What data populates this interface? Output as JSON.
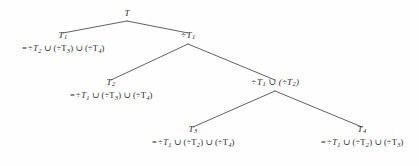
{
  "figure": {
    "type": "binary-tree-diagram",
    "title": "",
    "background_color": "#fefefe",
    "ink_color": "#2b2b2b",
    "symbols": {
      "complement": "÷",
      "union": "∪",
      "equals": "=",
      "paren_open": "(",
      "paren_close": ")"
    }
  },
  "nodes": [
    {
      "id": "root",
      "label": "T",
      "subscript": "",
      "expression": "",
      "x": 127,
      "y": 11,
      "align": "center"
    },
    {
      "id": "n-t1",
      "label": "T",
      "subscript": "1",
      "expression": "= ÷T₂ ∪ (÷T₃) ∪ (÷T₄)",
      "x": 63,
      "y": 33,
      "align": "center"
    },
    {
      "id": "n-not-t1",
      "label": "÷T",
      "subscript": "1",
      "expression": "",
      "x": 188,
      "y": 33,
      "align": "center"
    },
    {
      "id": "n-t2",
      "label": "T",
      "subscript": "2",
      "expression": "= ÷T₁ ∪ (÷T₃) ∪ (÷T₄)",
      "x": 111,
      "y": 80,
      "align": "center"
    },
    {
      "id": "n-not-t1-union-not-t2",
      "label": "÷T₁ ∪ (÷T₂)",
      "subscript": "",
      "expression": "",
      "x": 275,
      "y": 80,
      "align": "center"
    },
    {
      "id": "n-t3",
      "label": "T",
      "subscript": "3",
      "expression": "= ÷T₁ ∪ (÷T₂) ∪ (÷T₄)",
      "x": 193,
      "y": 127,
      "align": "center"
    },
    {
      "id": "n-t4",
      "label": "T",
      "subscript": "4",
      "expression": "= ÷T₁ ∪ (÷T₂) ∪ (÷T₃)",
      "x": 362,
      "y": 127,
      "align": "center"
    }
  ],
  "node_text": {
    "root": {
      "label": "T"
    },
    "t1": {
      "label": "T",
      "sub": "1",
      "eq": "=",
      "term1_op": "÷",
      "term1_var": "T",
      "term1_sub": "2",
      "u1": "∪",
      "term2": "(÷T",
      "term2_sub": "3",
      "term2_close": ")",
      "u2": "∪",
      "term3": "(÷T",
      "term3_sub": "4",
      "term3_close": ")"
    },
    "not_t1": {
      "op": "÷",
      "label": "T",
      "sub": "1"
    },
    "t2": {
      "label": "T",
      "sub": "2",
      "eq": "=",
      "term1_op": "÷",
      "term1_var": "T",
      "term1_sub": "1",
      "u1": "∪",
      "term2": "(÷T",
      "term2_sub": "3",
      "term2_close": ")",
      "u2": "∪",
      "term3": "(÷T",
      "term3_sub": "4",
      "term3_close": ")"
    },
    "not_t1_u_not_t2": {
      "op1": "÷",
      "var1": "T",
      "sub1": "1",
      "u1": "∪",
      "open": "(÷T",
      "sub2": "2",
      "close": ")"
    },
    "t3": {
      "label": "T",
      "sub": "3",
      "eq": "=",
      "term1_op": "÷",
      "term1_var": "T",
      "term1_sub": "1",
      "u1": "∪",
      "term2": "(÷T",
      "term2_sub": "2",
      "term2_close": ")",
      "u2": "∪",
      "term3": "(÷T",
      "term3_sub": "4",
      "term3_close": ")"
    },
    "t4": {
      "label": "T",
      "sub": "4",
      "eq": "=",
      "term1_op": "÷",
      "term1_var": "T",
      "term1_sub": "1",
      "u1": "∪",
      "term2": "(÷T",
      "term2_sub": "2",
      "term2_close": ")",
      "u2": "∪",
      "term3": "(÷T",
      "term3_sub": "3",
      "term3_close": ")"
    }
  },
  "edges": [
    {
      "id": "root-to-t1",
      "from": "root",
      "to": "n-t1",
      "x1": 127,
      "y1": 21,
      "x2": 63,
      "y2": 33
    },
    {
      "id": "root-to-not-t1",
      "from": "root",
      "to": "n-not-t1",
      "x1": 127,
      "y1": 21,
      "x2": 188,
      "y2": 33
    },
    {
      "id": "nott1-to-t2",
      "from": "n-not-t1",
      "to": "n-t2",
      "x1": 188,
      "y1": 44,
      "x2": 111,
      "y2": 80
    },
    {
      "id": "nott1-to-union",
      "from": "n-not-t1",
      "to": "n-not-t1-union-not-t2",
      "x1": 188,
      "y1": 44,
      "x2": 275,
      "y2": 80
    },
    {
      "id": "union-to-t3",
      "from": "n-not-t1-union-not-t2",
      "to": "n-t3",
      "x1": 275,
      "y1": 91,
      "x2": 193,
      "y2": 127
    },
    {
      "id": "union-to-t4",
      "from": "n-not-t1-union-not-t2",
      "to": "n-t4",
      "x1": 275,
      "y1": 91,
      "x2": 362,
      "y2": 127
    }
  ]
}
